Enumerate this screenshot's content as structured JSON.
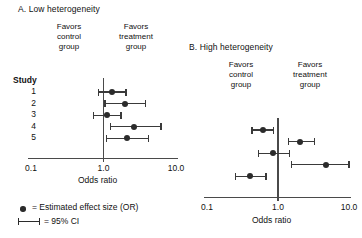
{
  "figure": {
    "point_color": "#2b2b2b",
    "axis_color": "#4a4a4a",
    "background": "#ffffff"
  },
  "legend": {
    "point_label": "= Estimated effect size (OR)",
    "ci_label": "= 95% CI"
  },
  "chart_data": [
    {
      "type": "scatter",
      "panel_id": "A",
      "title": "A. Low heterogeneity",
      "xlabel": "Odds ratio",
      "ylabel": "Study",
      "xscale": "log",
      "xlim": [
        0.1,
        10.0
      ],
      "tick_labels": [
        "0.1",
        "1.0",
        "10.0"
      ],
      "tick_values": [
        0.1,
        1.0,
        10.0
      ],
      "null_value": 1.0,
      "grid": false,
      "favors_left": "Favors\ncontrol\ngroup",
      "favors_right": "Favors\ntreatment\ngroup",
      "favors_left_lines": [
        "Favors",
        "control",
        "group"
      ],
      "favors_right_lines": [
        "Favors",
        "treatment",
        "group"
      ],
      "categories": [
        "1",
        "2",
        "3",
        "4",
        "5"
      ],
      "points": [
        {
          "study": "1",
          "or": 1.3,
          "ci_low": 0.85,
          "ci_high": 2.05
        },
        {
          "study": "2",
          "or": 2.0,
          "ci_low": 1.05,
          "ci_high": 3.8
        },
        {
          "study": "3",
          "or": 1.1,
          "ci_low": 0.72,
          "ci_high": 1.75
        },
        {
          "study": "4",
          "or": 2.6,
          "ci_low": 1.25,
          "ci_high": 6.2
        },
        {
          "study": "5",
          "or": 2.1,
          "ci_low": 1.1,
          "ci_high": 4.2
        }
      ]
    },
    {
      "type": "scatter",
      "panel_id": "B",
      "title": "B. High heterogeneity",
      "xlabel": "Odds ratio",
      "ylabel": "",
      "xscale": "log",
      "xlim": [
        0.1,
        10.0
      ],
      "tick_labels": [
        "0.1",
        "1.0",
        "10.0"
      ],
      "tick_values": [
        0.1,
        1.0,
        10.0
      ],
      "null_value": 1.0,
      "grid": false,
      "favors_left_lines": [
        "Favors",
        "control",
        "group"
      ],
      "favors_right_lines": [
        "Favors",
        "treatment",
        "group"
      ],
      "categories": [
        "1",
        "2",
        "3",
        "4",
        "5"
      ],
      "points": [
        {
          "study": "1",
          "or": 0.61,
          "ci_low": 0.43,
          "ci_high": 0.86
        },
        {
          "study": "2",
          "or": 2.05,
          "ci_low": 1.4,
          "ci_high": 3.3
        },
        {
          "study": "3",
          "or": 0.85,
          "ci_low": 0.53,
          "ci_high": 1.45
        },
        {
          "study": "4",
          "or": 4.8,
          "ci_low": 1.55,
          "ci_high": 10.0
        },
        {
          "study": "5",
          "or": 0.4,
          "ci_low": 0.25,
          "ci_high": 0.68
        }
      ]
    }
  ]
}
